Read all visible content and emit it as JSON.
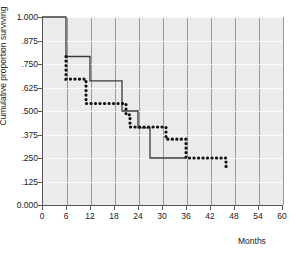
{
  "chart_data": {
    "type": "line",
    "title": "",
    "xlabel": "Months",
    "ylabel": "Cumulative proportion surviving",
    "xlim": [
      0,
      60
    ],
    "ylim": [
      0,
      1.0
    ],
    "grid": true,
    "legend": "none",
    "x_ticks": [
      "0",
      "6",
      "12",
      "18",
      "24",
      "30",
      "36",
      "42",
      "48",
      "54",
      "60"
    ],
    "x_tick_values": [
      0,
      6,
      12,
      18,
      24,
      30,
      36,
      42,
      48,
      54,
      60
    ],
    "y_ticks": [
      "0.000",
      ".125",
      ".250",
      ".375",
      ".500",
      ".625",
      ".750",
      ".875",
      "1.000"
    ],
    "y_tick_values": [
      0.0,
      0.125,
      0.25,
      0.375,
      0.5,
      0.625,
      0.75,
      0.875,
      1.0
    ],
    "series": [
      {
        "name": "solid-step-curve",
        "style": "solid",
        "color": "#3c3c3c",
        "x": [
          0,
          6,
          6,
          7,
          12,
          12,
          20,
          20,
          24,
          24,
          27,
          27,
          36
        ],
        "y": [
          1.0,
          1.0,
          0.79,
          0.79,
          0.79,
          0.66,
          0.66,
          0.5,
          0.5,
          0.41,
          0.41,
          0.25,
          0.25
        ]
      },
      {
        "name": "dotted-step-curve",
        "style": "dotted",
        "color": "#111111",
        "x": [
          6,
          6,
          7,
          9,
          11,
          11,
          12,
          14,
          18,
          21,
          21,
          22,
          22,
          30,
          31,
          31,
          33,
          36,
          36,
          46,
          46,
          47
        ],
        "y": [
          0.79,
          0.67,
          0.67,
          0.67,
          0.67,
          0.54,
          0.54,
          0.54,
          0.54,
          0.54,
          0.48,
          0.48,
          0.415,
          0.415,
          0.415,
          0.35,
          0.35,
          0.35,
          0.25,
          0.25,
          0.205,
          0.205
        ]
      }
    ]
  }
}
